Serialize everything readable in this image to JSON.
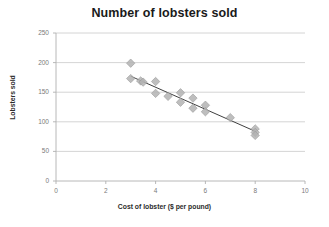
{
  "chart_data": {
    "type": "scatter",
    "title": "Number of lobsters sold",
    "xlabel": "Cost of lobster ($ per pound)",
    "ylabel": "Lobsters sold",
    "xlim": [
      0,
      10
    ],
    "ylim": [
      0,
      250
    ],
    "xticks": [
      0,
      2,
      4,
      6,
      8,
      10
    ],
    "yticks": [
      0,
      50,
      100,
      150,
      200,
      250
    ],
    "grid": "horizontal",
    "legend": "none",
    "marker": "diamond",
    "marker_color": "#b3b3b3",
    "trendline_color": "#404040",
    "points": [
      {
        "x": 3.0,
        "y": 199
      },
      {
        "x": 3.0,
        "y": 173
      },
      {
        "x": 3.4,
        "y": 169
      },
      {
        "x": 3.5,
        "y": 167
      },
      {
        "x": 4.0,
        "y": 168
      },
      {
        "x": 4.0,
        "y": 148
      },
      {
        "x": 4.5,
        "y": 143
      },
      {
        "x": 5.0,
        "y": 149
      },
      {
        "x": 5.0,
        "y": 133
      },
      {
        "x": 5.5,
        "y": 140
      },
      {
        "x": 5.5,
        "y": 123
      },
      {
        "x": 6.0,
        "y": 128
      },
      {
        "x": 6.0,
        "y": 117
      },
      {
        "x": 7.0,
        "y": 107
      },
      {
        "x": 8.0,
        "y": 88
      },
      {
        "x": 8.0,
        "y": 82
      },
      {
        "x": 8.0,
        "y": 77
      }
    ],
    "trendline": {
      "x1": 3.0,
      "y1": 177,
      "x2": 8.05,
      "y2": 83
    }
  }
}
